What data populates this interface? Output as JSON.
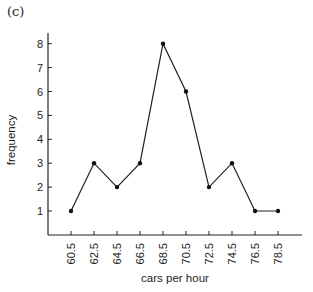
{
  "panel_label": "(c)",
  "chart_data": {
    "type": "line",
    "title": "",
    "xlabel": "cars per hour",
    "ylabel": "frequency",
    "categories": [
      "60.5",
      "62.5",
      "64.5",
      "66.5",
      "68.5",
      "70.5",
      "72.5",
      "74.5",
      "76.5",
      "78.5"
    ],
    "x": [
      60.5,
      62.5,
      64.5,
      66.5,
      68.5,
      70.5,
      72.5,
      74.5,
      76.5,
      78.5
    ],
    "values": [
      1,
      3,
      2,
      3,
      8,
      6,
      2,
      3,
      1,
      1
    ],
    "yticks": [
      1,
      2,
      3,
      4,
      5,
      6,
      7,
      8
    ],
    "ylim": [
      0,
      8.5
    ],
    "grid": false,
    "legend": null,
    "markers": true
  }
}
